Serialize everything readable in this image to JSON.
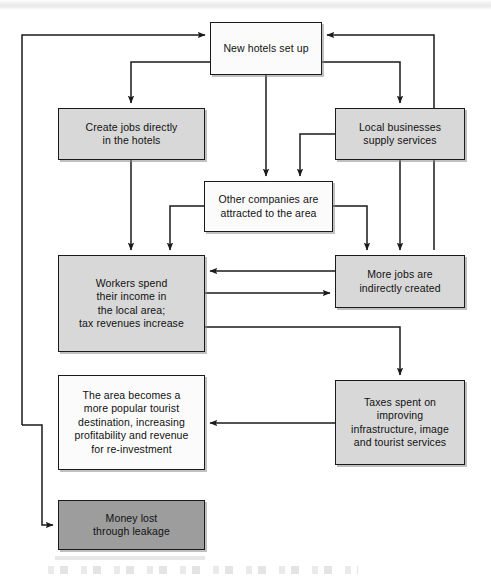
{
  "diagram": {
    "colors": {
      "stroke": "#1a1a1a",
      "fill_white": "#fbfbfb",
      "fill_light": "#d8d8d8",
      "fill_dark": "#9d9d9d",
      "text": "#111111"
    },
    "nodes": [
      {
        "id": "new-hotels",
        "label": "New hotels set up",
        "fill": "white",
        "x": 210,
        "y": 22,
        "w": 112,
        "h": 53
      },
      {
        "id": "create-jobs",
        "label": "Create jobs directly\nin the hotels",
        "fill": "light",
        "x": 58,
        "y": 108,
        "w": 147,
        "h": 52
      },
      {
        "id": "local-businesses",
        "label": "Local businesses\nsupply services",
        "fill": "light",
        "x": 335,
        "y": 108,
        "w": 130,
        "h": 52
      },
      {
        "id": "other-companies",
        "label": "Other companies are\nattracted to the area",
        "fill": "white",
        "x": 204,
        "y": 181,
        "w": 129,
        "h": 51
      },
      {
        "id": "workers-spend",
        "label": "Workers spend\ntheir income in\nthe local area;\ntax revenues increase",
        "fill": "light",
        "x": 58,
        "y": 255,
        "w": 147,
        "h": 97
      },
      {
        "id": "more-jobs",
        "label": "More jobs are\nindirectly created",
        "fill": "light",
        "x": 335,
        "y": 255,
        "w": 130,
        "h": 53
      },
      {
        "id": "area-becomes",
        "label": "The area becomes a\nmore popular tourist\ndestination, increasing\nprofitability and revenue\nfor re-investment",
        "fill": "white",
        "x": 58,
        "y": 375,
        "w": 147,
        "h": 95
      },
      {
        "id": "taxes-spent",
        "label": "Taxes spent on\nimproving\ninfrastructure, image\nand tourist services",
        "fill": "light",
        "x": 335,
        "y": 380,
        "w": 130,
        "h": 85
      },
      {
        "id": "money-lost",
        "label": "Money lost\nthrough leakage",
        "fill": "dark",
        "x": 58,
        "y": 500,
        "w": 147,
        "h": 50
      }
    ],
    "connectors": [
      {
        "id": "area-to-new-hotels",
        "from": "area-becomes",
        "to": "new-hotels"
      },
      {
        "id": "new-hotels-to-create-jobs",
        "from": "new-hotels",
        "to": "create-jobs"
      },
      {
        "id": "new-hotels-to-other-companies",
        "from": "new-hotels",
        "to": "other-companies"
      },
      {
        "id": "new-hotels-to-local-businesses",
        "from": "new-hotels",
        "to": "local-businesses"
      },
      {
        "id": "create-jobs-to-workers",
        "from": "create-jobs",
        "to": "workers-spend"
      },
      {
        "id": "local-businesses-to-other-companies",
        "from": "local-businesses",
        "to": "other-companies"
      },
      {
        "id": "local-businesses-to-more-jobs",
        "from": "local-businesses",
        "to": "more-jobs"
      },
      {
        "id": "local-businesses-to-new-hotels",
        "from": "local-businesses",
        "to": "new-hotels"
      },
      {
        "id": "other-companies-to-workers",
        "from": "other-companies",
        "to": "workers-spend"
      },
      {
        "id": "other-companies-to-more-jobs",
        "from": "other-companies",
        "to": "more-jobs"
      },
      {
        "id": "more-jobs-to-workers",
        "from": "more-jobs",
        "to": "workers-spend"
      },
      {
        "id": "workers-to-more-jobs",
        "from": "workers-spend",
        "to": "more-jobs"
      },
      {
        "id": "workers-to-taxes",
        "from": "workers-spend",
        "to": "taxes-spent"
      },
      {
        "id": "taxes-to-area",
        "from": "taxes-spent",
        "to": "area-becomes"
      },
      {
        "id": "area-to-money-lost",
        "from": "area-becomes",
        "to": "money-lost"
      }
    ]
  }
}
